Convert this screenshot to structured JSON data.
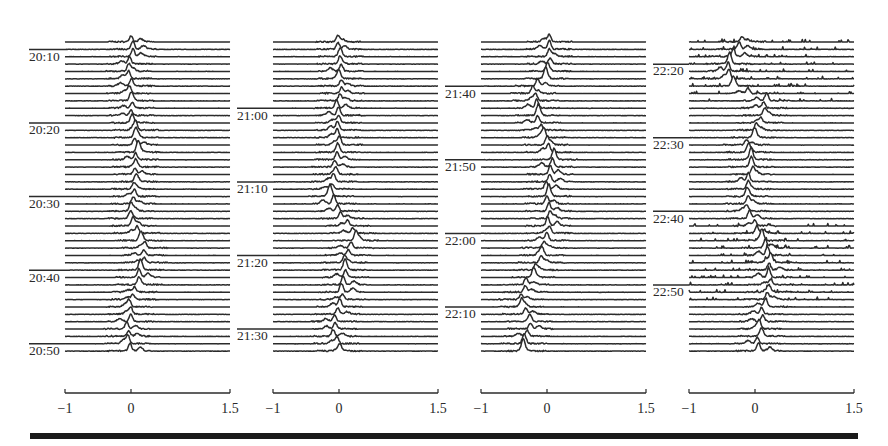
{
  "chart_data": {
    "type": "line",
    "subtype": "stacked-waterfall",
    "title": "",
    "xlabel": "",
    "ylabel": "",
    "x_range": [
      -1,
      1.5
    ],
    "x_ticks": [
      -1,
      0,
      1.5
    ],
    "x_tick_labels": [
      "-1",
      "0",
      "1.5"
    ],
    "grid": false,
    "legend": null,
    "trace_spacing_minutes": 1,
    "panels": [
      {
        "id": "panel-1",
        "x_left": 65,
        "x_right": 230,
        "first_trace_y": 42,
        "trace_count": 43,
        "trace_step": 7.36,
        "time_labels": [
          {
            "label": "20:10",
            "trace_index": 2
          },
          {
            "label": "20:20",
            "trace_index": 12
          },
          {
            "label": "20:30",
            "trace_index": 22
          },
          {
            "label": "20:40",
            "trace_index": 32
          },
          {
            "label": "20:50",
            "trace_index": 42
          }
        ],
        "peak_path": [
          [
            0,
            0.03
          ],
          [
            4,
            -0.03
          ],
          [
            8,
            0.0
          ],
          [
            12,
            0.05
          ],
          [
            16,
            0.08
          ],
          [
            20,
            0.06
          ],
          [
            24,
            -0.02
          ],
          [
            28,
            0.2
          ],
          [
            32,
            0.15
          ],
          [
            36,
            0.0
          ],
          [
            40,
            -0.05
          ],
          [
            42,
            -0.02
          ]
        ],
        "noise": 0.35
      },
      {
        "id": "panel-2",
        "x_left": 273,
        "x_right": 438,
        "first_trace_y": 42,
        "trace_count": 43,
        "trace_step": 7.36,
        "time_labels": [
          {
            "label": "21:00",
            "trace_index": 10
          },
          {
            "label": "21:10",
            "trace_index": 20
          },
          {
            "label": "21:20",
            "trace_index": 30
          },
          {
            "label": "21:30",
            "trace_index": 40
          }
        ],
        "peak_path": [
          [
            0,
            -0.02
          ],
          [
            6,
            0.02
          ],
          [
            10,
            -0.02
          ],
          [
            14,
            0.0
          ],
          [
            18,
            -0.05
          ],
          [
            21,
            -0.12
          ],
          [
            24,
            0.05
          ],
          [
            27,
            0.25
          ],
          [
            30,
            0.1
          ],
          [
            34,
            0.05
          ],
          [
            38,
            -0.05
          ],
          [
            40,
            -0.12
          ],
          [
            42,
            0.0
          ]
        ],
        "noise": 0.35
      },
      {
        "id": "panel-3",
        "x_left": 481,
        "x_right": 646,
        "first_trace_y": 42,
        "trace_count": 43,
        "trace_step": 7.36,
        "time_labels": [
          {
            "label": "21:40",
            "trace_index": 7
          },
          {
            "label": "21:50",
            "trace_index": 17
          },
          {
            "label": "22:00",
            "trace_index": 27
          },
          {
            "label": "22:10",
            "trace_index": 37
          }
        ],
        "peak_path": [
          [
            0,
            0.02
          ],
          [
            3,
            0.05
          ],
          [
            5,
            -0.05
          ],
          [
            7,
            -0.2
          ],
          [
            10,
            -0.15
          ],
          [
            13,
            -0.05
          ],
          [
            16,
            0.1
          ],
          [
            20,
            0.0
          ],
          [
            24,
            0.05
          ],
          [
            27,
            0.02
          ],
          [
            30,
            -0.1
          ],
          [
            33,
            -0.3
          ],
          [
            36,
            -0.4
          ],
          [
            38,
            -0.25
          ],
          [
            40,
            -0.3
          ],
          [
            42,
            -0.35
          ]
        ],
        "noise": 0.4
      },
      {
        "id": "panel-4",
        "x_left": 689,
        "x_right": 854,
        "first_trace_y": 42,
        "trace_count": 43,
        "trace_step": 7.36,
        "time_labels": [
          {
            "label": "22:20",
            "trace_index": 4
          },
          {
            "label": "22:30",
            "trace_index": 14
          },
          {
            "label": "22:40",
            "trace_index": 24
          },
          {
            "label": "22:50",
            "trace_index": 34
          }
        ],
        "peak_path": [
          [
            0,
            -0.2
          ],
          [
            3,
            -0.4
          ],
          [
            6,
            -0.35
          ],
          [
            8,
            0.15
          ],
          [
            11,
            0.1
          ],
          [
            14,
            -0.1
          ],
          [
            18,
            -0.05
          ],
          [
            21,
            -0.15
          ],
          [
            24,
            -0.1
          ],
          [
            27,
            0.1
          ],
          [
            30,
            0.25
          ],
          [
            34,
            0.2
          ],
          [
            38,
            0.1
          ],
          [
            42,
            0.05
          ]
        ],
        "noise": 0.45,
        "noisy_traces": [
          0,
          1,
          2,
          3,
          4,
          5,
          6,
          7,
          8,
          25,
          26,
          27,
          28,
          29,
          30,
          31,
          32,
          33,
          34,
          35
        ]
      }
    ]
  },
  "figure": {
    "axis_y": 393,
    "tick_label_y": 413,
    "bottom_rule": {
      "x1": 30,
      "x2": 858,
      "y": 433,
      "height": 6,
      "color": "#1a1a1a"
    },
    "trace_color": "#2b2b2b",
    "text_color": "#2a2a2a"
  }
}
